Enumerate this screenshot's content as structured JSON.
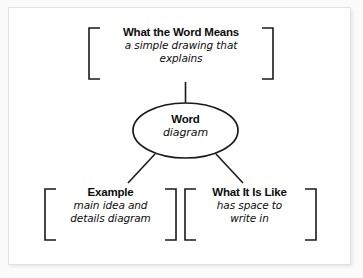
{
  "diagram": {
    "type": "word-diagram-graphic-organizer",
    "background_color": "#ffffff",
    "panel_border_color": "#e2e2e2",
    "line_color": "#1a1a1a",
    "text_color": "#0d0d0d",
    "center": {
      "shape": "ellipse",
      "title": "Word",
      "body": "diagram"
    },
    "nodes": [
      {
        "id": "what-the-word-means",
        "position": "top",
        "bracket": "square-pair",
        "title": "What the Word Means",
        "body_lines": [
          "a simple drawing that",
          "explains"
        ]
      },
      {
        "id": "example",
        "position": "bottom-left",
        "bracket": "square-pair",
        "title": "Example",
        "body_lines": [
          "main idea and",
          "details diagram"
        ]
      },
      {
        "id": "what-it-is-like",
        "position": "bottom-right",
        "bracket": "square-pair",
        "title": "What It Is Like",
        "body_lines": [
          "has space to",
          "write in"
        ]
      }
    ],
    "connectors": [
      {
        "id": "center-to-top",
        "from": "center",
        "to": "what-the-word-means",
        "style": "straight-vertical"
      },
      {
        "id": "center-to-bottom-left",
        "from": "center",
        "to": "example",
        "style": "straight-diagonal"
      },
      {
        "id": "center-to-bottom-right",
        "from": "center",
        "to": "what-it-is-like",
        "style": "straight-diagonal"
      }
    ]
  }
}
